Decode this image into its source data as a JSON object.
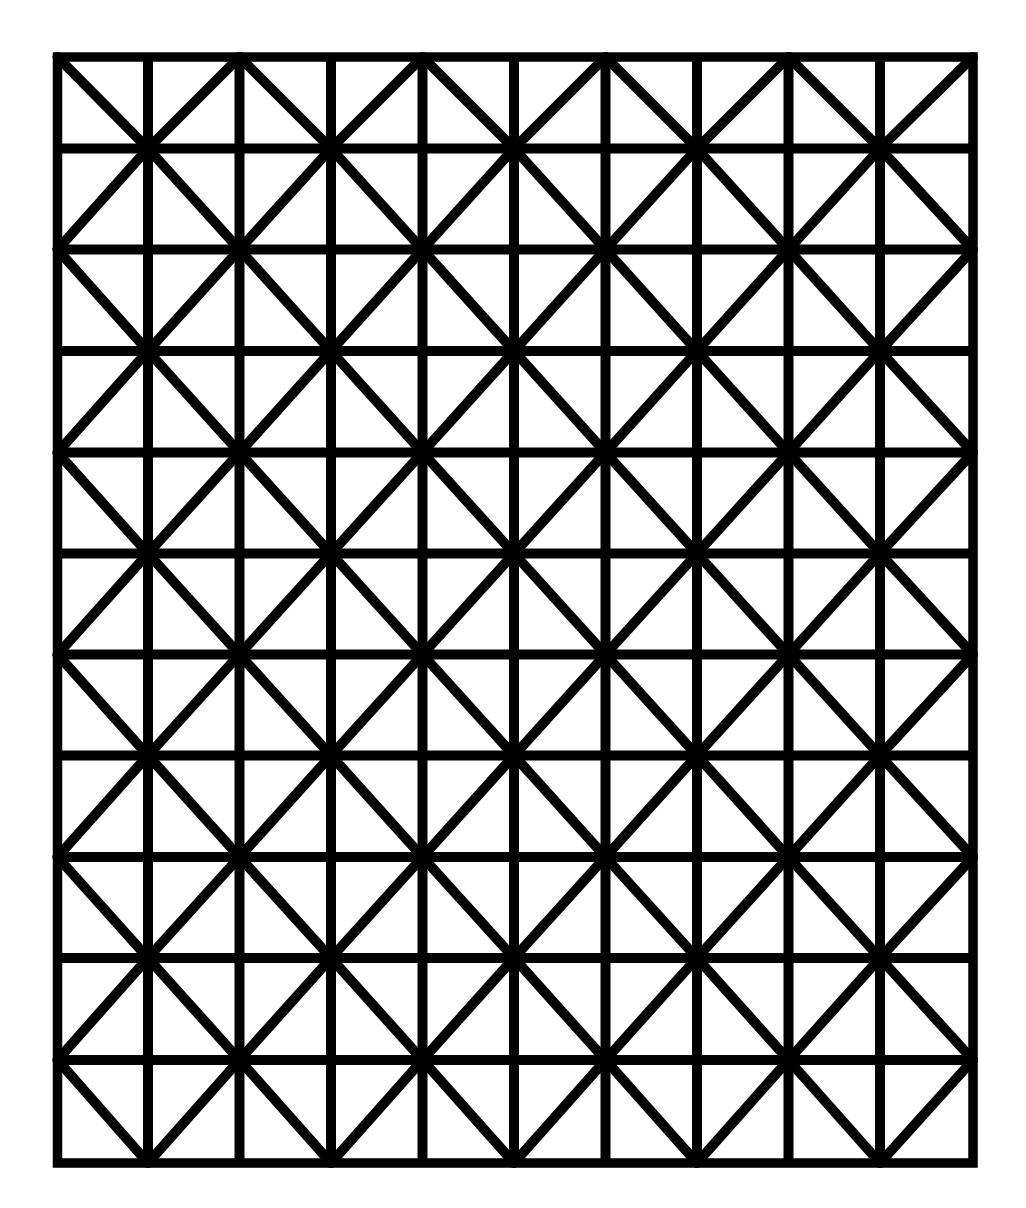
{
  "diagram": {
    "type": "square-grid-with-alternating-diagonals",
    "columns": 10,
    "rows": 11,
    "colors": {
      "background": "#ffffff",
      "line": "#000000"
    },
    "stroke": {
      "border_width": 9.5,
      "grid_width": 10,
      "diagonal_width": 10
    },
    "vertical_lines_x": [
      57.5,
      148,
      239.5,
      331,
      422.5,
      514,
      605.5,
      697,
      788.5,
      880,
      973
    ],
    "horizontal_lines_y": [
      57,
      148.5,
      249.5,
      351,
      452.5,
      553.5,
      654.5,
      755.5,
      857,
      958,
      1060,
      1163
    ],
    "diagonal_rule": "cell (col,row) with even col+row runs top-left to bottom-right; odd runs top-right to bottom-left; forms a diamond lattice through every other grid vertex"
  }
}
